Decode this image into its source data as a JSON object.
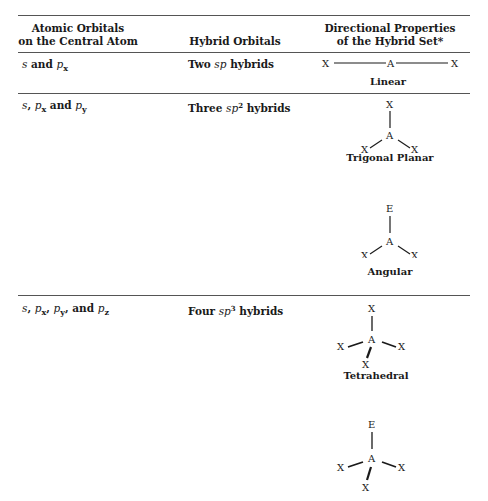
{
  "table": {
    "headers": [
      {
        "line1": "Atomic Orbitals",
        "line2": "on the Central Atom"
      },
      {
        "line1": "",
        "line2": "Hybrid Orbitals"
      },
      {
        "line1": "Directional Properties",
        "line2": "of the Hybrid Set*"
      }
    ],
    "rows": [
      {
        "orbitals": {
          "parts": [
            "s",
            " and ",
            "p",
            "x"
          ]
        },
        "hybrid": {
          "prefix": "Two ",
          "sp": "sp",
          "sup": "",
          "suffix": " hybrids"
        },
        "geometries": [
          {
            "name": "Linear",
            "atoms": {
              "center": "A",
              "left": "X",
              "right": "X"
            }
          }
        ]
      },
      {
        "orbitals": {
          "parts": [
            "s",
            ", ",
            "p",
            "x",
            " and ",
            "p",
            "y"
          ]
        },
        "hybrid": {
          "prefix": "Three ",
          "sp": "sp",
          "sup": "2",
          "suffix": " hybrids"
        },
        "geometries": [
          {
            "name": "Trigonal Planar",
            "atoms": {
              "center": "A",
              "top": "X",
              "left": "X",
              "right": "X"
            }
          },
          {
            "name": "Angular",
            "atoms": {
              "center": "A",
              "top": "E",
              "left": "X",
              "right": "X"
            }
          }
        ]
      },
      {
        "orbitals": {
          "parts": [
            "s",
            ", ",
            "p",
            "x",
            ", ",
            "p",
            "y",
            ", and ",
            "p",
            "z"
          ]
        },
        "hybrid": {
          "prefix": "Four ",
          "sp": "sp",
          "sup": "3",
          "suffix": " hybrids"
        },
        "geometries": [
          {
            "name": "Tetrahedral",
            "atoms": {
              "center": "A",
              "top": "X",
              "left": "X",
              "right": "X",
              "bottom": "X"
            }
          },
          {
            "name": "",
            "atoms": {
              "center": "A",
              "top": "E",
              "left": "X",
              "right": "X",
              "bottom": "X"
            }
          }
        ]
      }
    ]
  }
}
